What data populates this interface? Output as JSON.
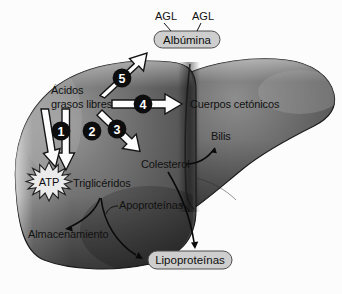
{
  "figure": {
    "language": "es",
    "background_color": "#fcfcfc",
    "organ": {
      "name": "Hígado",
      "fill_dark": "#4a4a4a",
      "fill_mid": "#6e6e6e",
      "fill_light": "#9a9a9a",
      "outline_color": "#1a1a1a"
    }
  },
  "labels": {
    "agl_left": "AGL",
    "agl_right": "AGL",
    "albumina": "Albúmina",
    "acidos_line1": "Ácidos",
    "acidos_line2": "grasos libres",
    "cuerpos_cetonicos": "Cuerpos cetónicos",
    "bilis": "Bilis",
    "colesterol": "Colesterol",
    "atp": "ATP",
    "trigliceridos": "Triglicéridos",
    "apoproteinas": "Apoproteínas",
    "almacenamiento": "Almacenamiento",
    "lipoproteinas": "Lipoproteínas"
  },
  "pathways": [
    {
      "number": "1",
      "from": "Ácidos grasos libres",
      "to": "ATP",
      "arrow_color": "#fdfdfd",
      "badge_color": "#0d0d0d"
    },
    {
      "number": "2",
      "from": "Ácidos grasos libres",
      "to": "Triglicéridos",
      "arrow_color": "#fdfdfd",
      "badge_color": "#0d0d0d"
    },
    {
      "number": "3",
      "from": "Ácidos grasos libres",
      "to": "Colesterol",
      "arrow_color": "#fdfdfd",
      "badge_color": "#0d0d0d"
    },
    {
      "number": "4",
      "from": "Ácidos grasos libres",
      "to": "Cuerpos cetónicos",
      "arrow_color": "#fdfdfd",
      "badge_color": "#0d0d0d"
    },
    {
      "number": "5",
      "from": "Ácidos grasos libres",
      "to": "Albúmina",
      "arrow_color": "#fdfdfd",
      "badge_color": "#0d0d0d"
    }
  ],
  "secondary_flows": [
    {
      "from": "Triglicéridos",
      "to": "Almacenamiento"
    },
    {
      "from": "Triglicéridos",
      "to": "Lipoproteínas"
    },
    {
      "from": "Apoproteínas",
      "to": "Lipoproteínas"
    },
    {
      "from": "Colesterol",
      "to": "Bilis"
    },
    {
      "from": "Colesterol",
      "to": "Lipoproteínas"
    }
  ],
  "pill_nodes": [
    {
      "label": "Albúmina",
      "fill": "#cfcfcf",
      "stroke": "#4a4a4a"
    },
    {
      "label": "Lipoproteínas",
      "fill": "#cfcfcf",
      "stroke": "#4a4a4a"
    }
  ]
}
